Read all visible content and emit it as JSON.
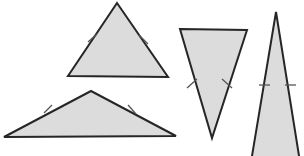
{
  "figure": {
    "canvas": {
      "width": 304,
      "height": 156
    },
    "background_color": "#ffffff",
    "fill_color": "#dcdcdc",
    "stroke_color": "#262626",
    "tick_color": "#555555",
    "stroke_width": 2,
    "tick_width": 1.3,
    "tick_length": 9,
    "shapes": [
      {
        "id": "triangle-1",
        "label": "Isosceles triangle, apex up",
        "points": "117,3 168,77 68,76",
        "ticks": [
          {
            "label": "tick-left",
            "x1": 88,
            "y1": 42,
            "x2": 97,
            "y2": 34
          },
          {
            "label": "tick-right",
            "x1": 139,
            "y1": 35,
            "x2": 148,
            "y2": 44
          }
        ]
      },
      {
        "id": "triangle-2",
        "label": "Wide isosceles triangle, apex up",
        "points": "91,91 176,136 4,137",
        "ticks": [
          {
            "label": "tick-left",
            "x1": 44,
            "y1": 113,
            "x2": 52,
            "y2": 105
          },
          {
            "label": "tick-right",
            "x1": 128,
            "y1": 105,
            "x2": 136,
            "y2": 114
          }
        ]
      },
      {
        "id": "triangle-3",
        "label": "Inverted isosceles triangle, apex down",
        "points": "180,29 247,30 212,138",
        "ticks": [
          {
            "label": "tick-left",
            "x1": 187,
            "y1": 88,
            "x2": 197,
            "y2": 79
          },
          {
            "label": "tick-right",
            "x1": 222,
            "y1": 79,
            "x2": 232,
            "y2": 88
          }
        ]
      },
      {
        "id": "triangle-4",
        "label": "Tall narrow isosceles triangle, cropped at bottom",
        "points": "276,12 300,162 251,162",
        "ticks": [
          {
            "label": "tick-left",
            "x1": 259,
            "y1": 85,
            "x2": 270,
            "y2": 85
          },
          {
            "label": "tick-right",
            "x1": 285,
            "y1": 85,
            "x2": 296,
            "y2": 85
          }
        ]
      }
    ]
  }
}
